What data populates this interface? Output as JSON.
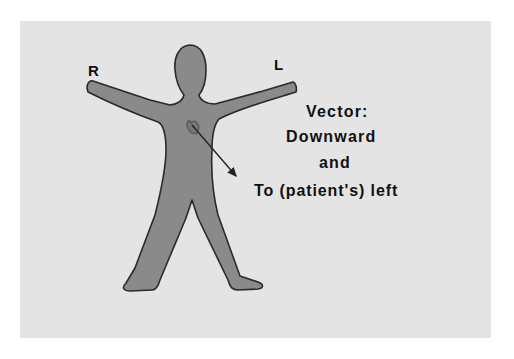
{
  "diagram": {
    "labels": {
      "right": "R",
      "left": "L"
    },
    "caption": {
      "line1": "Vector:",
      "line2": "Downward",
      "line3": "and",
      "line4": "To (patient's) left"
    },
    "colors": {
      "background": "#e4e4e4",
      "figure_fill": "#8a8a8a",
      "figure_outline": "#2a2a2a",
      "heart": "#777777",
      "arrow": "#222222",
      "text": "#111111"
    }
  }
}
